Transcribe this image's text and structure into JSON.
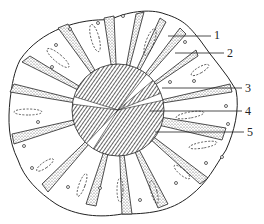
{
  "figure": {
    "colors": {
      "ink": "#222222",
      "background": "#ffffff",
      "stipple": "#555555"
    },
    "center": [
      118,
      110
    ],
    "inner_radius": 46,
    "labels": [
      {
        "id": "1",
        "text": "1",
        "x": 214,
        "y": 29,
        "line_from": [
          168,
          36
        ],
        "line_to": [
          211,
          36
        ]
      },
      {
        "id": "2",
        "text": "2",
        "x": 227,
        "y": 47,
        "line_from": [
          175,
          53
        ],
        "line_to": [
          224,
          53
        ]
      },
      {
        "id": "3",
        "text": "3",
        "x": 245,
        "y": 82,
        "line_from": [
          162,
          88
        ],
        "line_to": [
          242,
          88
        ]
      },
      {
        "id": "4",
        "text": "4",
        "x": 245,
        "y": 105,
        "line_from": [
          150,
          111
        ],
        "line_to": [
          242,
          111
        ]
      },
      {
        "id": "5",
        "text": "5",
        "x": 247,
        "y": 126,
        "line_from": [
          155,
          132
        ],
        "line_to": [
          244,
          132
        ]
      }
    ]
  }
}
